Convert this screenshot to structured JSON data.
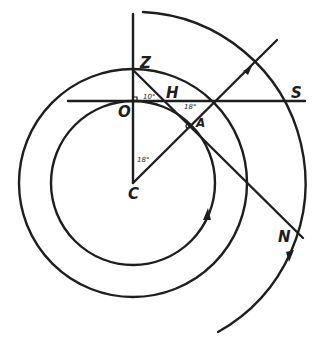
{
  "diagram": {
    "labels": {
      "Z": "Z",
      "H": "H",
      "S": "S",
      "O": "O",
      "C": "C",
      "N": "N",
      "A": "A"
    },
    "angles": {
      "at_O": "10°",
      "at_H": "18°",
      "at_C": "18°"
    },
    "colors": {
      "ink": "#1e1e1e",
      "background": "#ffffff"
    }
  }
}
